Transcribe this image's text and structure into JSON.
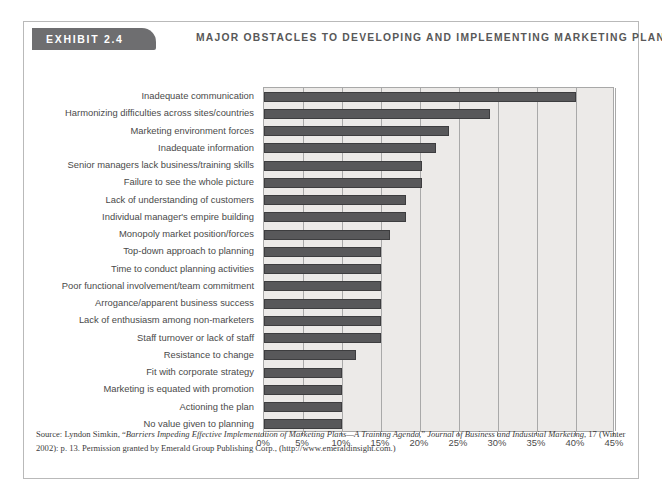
{
  "exhibit": {
    "tab_label": "EXHIBIT 2.4",
    "title": "MAJOR OBSTACLES TO DEVELOPING AND IMPLEMENTING MARKETING PLANS"
  },
  "colors": {
    "bar": "#58585a",
    "bar_border": "#3d3d3f",
    "plot_background": "#eceae8",
    "gridline": "#a9a9a9",
    "tab_background": "#6e6e70",
    "title_text": "#585858",
    "frame": "#b9b9b9"
  },
  "source": {
    "line1_prefix": "Source: Lyndon Simkin, “",
    "line1_italic": "Barriers Impeding Effective Implementation of Marketing Plans—A Training Agenda,",
    "line1_mid": "” ",
    "line1_italic2": "Journal of Business and Industrial Marketing",
    "line1_suffix": ", 17 (Winter 2002): p. 13. Permission granted by Emerald Group Publishing Corp., (http://www.emeraldinsight.com.)"
  },
  "chart_data": {
    "type": "bar",
    "orientation": "horizontal",
    "title": "MAJOR OBSTACLES TO DEVELOPING AND IMPLEMENTING MARKETING PLANS",
    "xlabel": "",
    "ylabel": "",
    "xlim": [
      0,
      45
    ],
    "xticks": [
      0,
      5,
      10,
      15,
      20,
      25,
      30,
      35,
      40,
      45
    ],
    "xticklabels": [
      "0%",
      "5%",
      "10%",
      "15%",
      "20%",
      "25%",
      "30%",
      "35%",
      "40%",
      "45%"
    ],
    "grid": true,
    "legend": false,
    "units": "percent",
    "categories": [
      "Inadequate communication",
      "Harmonizing difficulties across sites/countries",
      "Marketing environment forces",
      "Inadequate information",
      "Senior managers lack business/training skills",
      "Failure to see the whole picture",
      "Lack of understanding of customers",
      "Individual manager's empire building",
      "Monopoly market position/forces",
      "Top-down approach to planning",
      "Time to conduct planning activities",
      "Poor functional involvement/team commitment",
      "Arrogance/apparent business success",
      "Lack of enthusiasm among non-marketers",
      "Staff turnover or lack of staff",
      "Resistance to change",
      "Fit with corporate strategy",
      "Marketing is equated with promotion",
      "Actioning the plan",
      "No value given to planning"
    ],
    "values": [
      40,
      29,
      23.7,
      22,
      20.3,
      20.3,
      18.2,
      18.2,
      16.2,
      15,
      15,
      15,
      15,
      15,
      15,
      11.8,
      10,
      10,
      10,
      10
    ]
  }
}
